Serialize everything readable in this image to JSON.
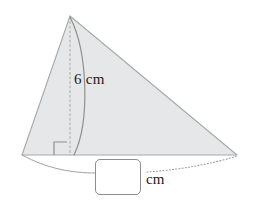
{
  "figure": {
    "shape": "triangle",
    "fill_color": "#e6e7e8",
    "stroke_color": "#a7a9ac",
    "dimension_color": "#9a9a9a",
    "text_color": "#1b1b1b",
    "background_color": "#ffffff",
    "height_label": "6 cm",
    "height_value": "6",
    "height_unit": "cm",
    "right_angle_marker": "right-angle",
    "base_dimension_style": "curved-leader-line",
    "vertices": {
      "apex": "70,16",
      "bottom_left": "22,155",
      "bottom_right": "237,155"
    }
  },
  "answer": {
    "value": "",
    "placeholder": "",
    "unit_label": "cm"
  }
}
